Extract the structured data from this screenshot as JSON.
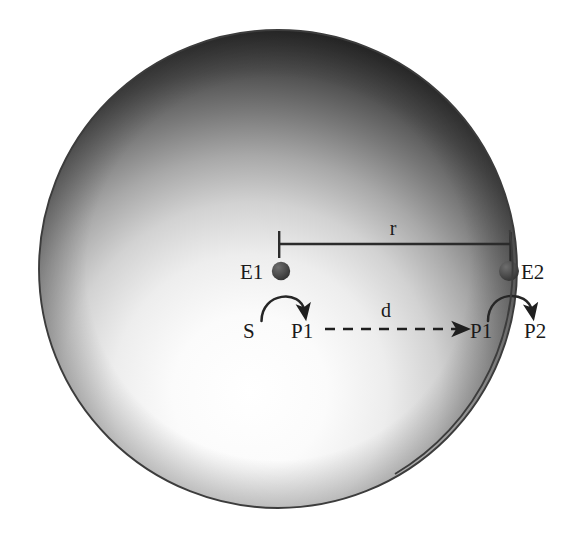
{
  "figure": {
    "name": "enzyme-cascade-in-cell-diagram",
    "background_color": "#ffffff",
    "cell": {
      "name": "cell-body",
      "shape": "circle",
      "center_x": 278,
      "center_y": 269,
      "radius": 239,
      "outline_color": "#3a3a3a",
      "gradient": {
        "type": "radial",
        "highlight_x": 250,
        "highlight_y": 392,
        "stops": [
          "#ffffff",
          "#f2f2f2",
          "#bdbdbd",
          "#6b6b6b",
          "#2a2a2a",
          "#151515"
        ]
      }
    },
    "enzymes": [
      {
        "id": "E1",
        "label": "E1",
        "label_x": 240,
        "label_y": 279,
        "node_x": 281,
        "node_y": 271,
        "node_radius": 9,
        "node_color": "#4a4a4a",
        "position_note": "interior-of-cell"
      },
      {
        "id": "E2",
        "label": "E2",
        "label_x": 521,
        "label_y": 279,
        "node_x": 509,
        "node_y": 271,
        "node_radius": 10,
        "node_color": "#4a4a4a",
        "position_note": "on-cell-membrane"
      }
    ],
    "species": [
      {
        "id": "S",
        "label": "S",
        "x": 243,
        "y": 338
      },
      {
        "id": "P1-left",
        "label": "P1",
        "x": 291,
        "y": 338
      },
      {
        "id": "P1-right",
        "label": "P1",
        "x": 470,
        "y": 338
      },
      {
        "id": "P2",
        "label": "P2",
        "x": 524,
        "y": 338
      }
    ],
    "reactions": [
      {
        "id": "reaction-E1",
        "label": "",
        "from": "S",
        "to": "P1",
        "catalyst": "E1",
        "arrow_style": "curved-solid",
        "color": "#262626"
      },
      {
        "id": "reaction-E2",
        "label": "",
        "from": "P1",
        "to": "P2",
        "catalyst": "E2",
        "arrow_style": "curved-solid",
        "color": "#262626"
      }
    ],
    "transport": {
      "id": "diffusion-arrow",
      "label": "d",
      "label_x": 386,
      "label_y": 317,
      "from": "P1-left",
      "to": "P1-right",
      "arrow_style": "dashed-straight",
      "y": 329,
      "x_start": 325,
      "x_end": 462,
      "color": "#1f1f1f",
      "meaning": "diffusion distance"
    },
    "dimension": {
      "id": "radius-dimension",
      "label": "r",
      "label_x": 393,
      "label_y": 235,
      "y": 244,
      "x_start": 279,
      "x_end": 511,
      "tick_top": 231,
      "tick_bottom": 256,
      "color": "#2b2b2b",
      "meaning": "distance from E1 to E2"
    }
  }
}
